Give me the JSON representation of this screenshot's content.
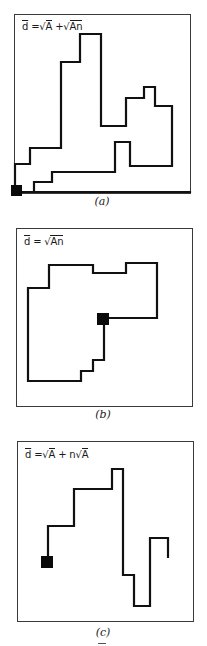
{
  "figure": {
    "stroke_color": "#111111",
    "frame_color": "#3a3a3a",
    "panels": [
      {
        "id": "a",
        "caption": "(a)",
        "formula": {
          "d": "d",
          "eq": " =",
          "parts": [
            "√",
            "A",
            " +",
            "√",
            "An"
          ]
        },
        "formula_text": "d̄ = √A + √An",
        "frame": {
          "x": 14,
          "y": 14,
          "w": 177,
          "h": 180
        },
        "marker": {
          "x": 11,
          "y": 185,
          "w": 11,
          "h": 11
        },
        "paths": [
          "M15,186 L15,164 L30,164 L30,148 L61,148 L61,62 L80,62 L80,34 L101,34 L101,126 L126,126 L126,98 L144,98 L144,87 L155,87 L155,106 L172,106 L172,166 L130,166 L130,142 L115,142 L115,172 L52,172 L52,182 L34,182 L34,192",
          "M22,192 L190,192"
        ],
        "caption_pos": {
          "x": 82,
          "y": 195
        }
      },
      {
        "id": "b",
        "caption": "(b)",
        "formula_text": "d̄ = √An",
        "frame": {
          "x": 16,
          "y": 228,
          "w": 177,
          "h": 179
        },
        "marker": {
          "x": 97,
          "y": 313,
          "w": 12,
          "h": 12
        },
        "paths": [
          "M109,318 L157,318 L157,263 L126,263 L126,273 L93,273 L93,265 L49,265 L49,288 L28,288 L28,381 L81,381 L81,371 L93,371 L93,360 L104,360 L104,325"
        ],
        "caption_pos": {
          "x": 83,
          "y": 409
        }
      },
      {
        "id": "c",
        "caption": "(c)",
        "formula_text": "d̄ = √A + n√A",
        "frame": {
          "x": 17,
          "y": 441,
          "w": 177,
          "h": 181
        },
        "marker": {
          "x": 41,
          "y": 556,
          "w": 12,
          "h": 12
        },
        "paths": [
          "M48,556 L48,526 L74,526 L74,489 L112,489 L112,469 L123,469 L123,575 L134,575 L134,606 L150,606 L150,538 L168,538 L168,557"
        ],
        "caption_pos": {
          "x": 83,
          "y": 626
        }
      }
    ]
  },
  "labels": {
    "a": {
      "d": "d",
      "rest": " =",
      "r1": "A",
      "plus1": " +",
      "r2": "An"
    },
    "b": {
      "d": "d",
      "rest": " = ",
      "r1": "An"
    },
    "c": {
      "d": "d",
      "rest": " =",
      "r1": "A",
      "plus1": " + n",
      "r2": "A"
    },
    "sqrt_symbol": "√"
  }
}
